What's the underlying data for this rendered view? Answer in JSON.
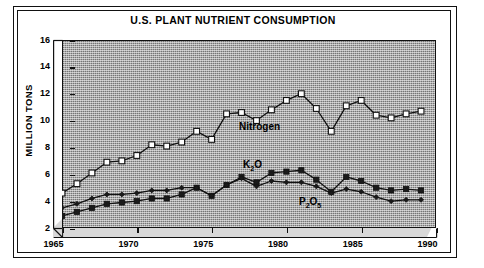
{
  "chart_title": "U.S. PLANT NUTRIENT CONSUMPTION",
  "axes": {
    "ylabel": "MILLION TONS",
    "yticks": [
      "16",
      "14",
      "12",
      "10",
      "8",
      "6",
      "4",
      "2"
    ],
    "xticks": [
      "1965",
      "1970",
      "1975",
      "1980",
      "1985",
      "1990"
    ]
  },
  "series_labels": {
    "nitrogen": "Nitrogen",
    "k2o_main": "K",
    "k2o_sub": "2",
    "k2o_tail": "O",
    "p2o5_p": "P",
    "p2o5_sub1": "2",
    "p2o5_o": "O",
    "p2o5_sub2": "5"
  },
  "colors": {
    "ink": "#111111",
    "panel_gray": "#a9a9a9",
    "floor_gray": "#d8d8d8",
    "marker_open": "#ffffff",
    "marker_fill": "#1a1a1a",
    "page": "#ffffff"
  },
  "chart_data": {
    "type": "line",
    "title": "U.S. PLANT NUTRIENT CONSUMPTION",
    "xlabel": "",
    "ylabel": "MILLION TONS",
    "xlim": [
      1965,
      1990
    ],
    "ylim": [
      2,
      16
    ],
    "xticks": [
      1965,
      1970,
      1975,
      1980,
      1985,
      1990
    ],
    "yticks": [
      2,
      4,
      6,
      8,
      10,
      12,
      14,
      16
    ],
    "grid": false,
    "legend": "inline-annotations",
    "x": [
      1965,
      1966,
      1967,
      1968,
      1969,
      1970,
      1971,
      1972,
      1973,
      1974,
      1975,
      1976,
      1977,
      1978,
      1979,
      1980,
      1981,
      1982,
      1983,
      1984,
      1985,
      1986,
      1987,
      1988,
      1989
    ],
    "series": [
      {
        "name": "Nitrogen",
        "marker": "open-square",
        "values": [
          4.6,
          5.3,
          6.1,
          6.9,
          7.0,
          7.4,
          8.2,
          8.1,
          8.4,
          9.2,
          8.6,
          10.5,
          10.6,
          10.0,
          10.8,
          11.5,
          12.0,
          10.9,
          9.2,
          11.1,
          11.5,
          10.4,
          10.2,
          10.5,
          10.7
        ]
      },
      {
        "name": "K2O",
        "marker": "filled-square",
        "values": [
          2.9,
          3.2,
          3.5,
          3.8,
          3.9,
          4.0,
          4.2,
          4.2,
          4.5,
          5.0,
          4.4,
          5.2,
          5.8,
          5.4,
          6.1,
          6.2,
          6.3,
          5.6,
          4.7,
          5.8,
          5.5,
          5.0,
          4.8,
          4.9,
          4.8
        ]
      },
      {
        "name": "P2O5",
        "marker": "filled-diamond",
        "values": [
          3.5,
          3.8,
          4.2,
          4.5,
          4.5,
          4.6,
          4.8,
          4.8,
          5.0,
          5.0,
          4.4,
          5.2,
          5.7,
          5.1,
          5.5,
          5.4,
          5.4,
          5.1,
          4.6,
          4.9,
          4.7,
          4.3,
          4.0,
          4.1,
          4.1
        ]
      }
    ]
  }
}
